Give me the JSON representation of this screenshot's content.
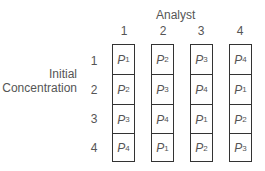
{
  "header": {
    "column_axis_title": "Analyst",
    "row_axis_title_line1": "Initial",
    "row_axis_title_line2": "Concentration"
  },
  "columns": [
    "1",
    "2",
    "3",
    "4"
  ],
  "rows": [
    "1",
    "2",
    "3",
    "4"
  ],
  "cell_symbol": "P",
  "grid": [
    [
      "1",
      "2",
      "3",
      "4"
    ],
    [
      "2",
      "3",
      "4",
      "1"
    ],
    [
      "3",
      "4",
      "1",
      "2"
    ],
    [
      "4",
      "1",
      "2",
      "3"
    ]
  ],
  "grid_labels": [
    [
      "P1",
      "P2",
      "P3",
      "P4"
    ],
    [
      "P2",
      "P3",
      "P4",
      "P1"
    ],
    [
      "P3",
      "P4",
      "P1",
      "P2"
    ],
    [
      "P4",
      "P1",
      "P2",
      "P3"
    ]
  ],
  "colors": {
    "text": "#555555",
    "border": "#333333",
    "background": "#ffffff"
  }
}
